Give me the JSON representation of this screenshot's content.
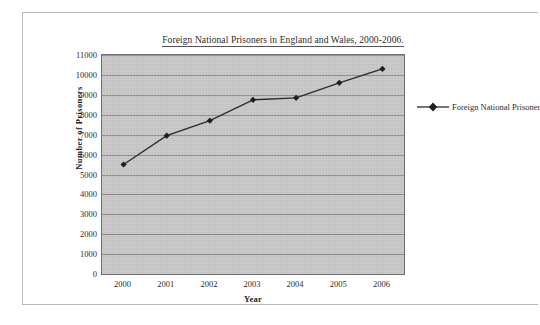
{
  "chart_data": {
    "type": "line",
    "title": "Foreign National Prisoners in England and Wales, 2000-2006.",
    "xlabel": "Year",
    "ylabel": "Number of Prisoners",
    "categories": [
      "2000",
      "2001",
      "2002",
      "2003",
      "2004",
      "2005",
      "2006"
    ],
    "series": [
      {
        "name": "Foreign National Prisoner",
        "values": [
          5500,
          6950,
          7700,
          8750,
          8850,
          9600,
          10300
        ]
      }
    ],
    "ylim": [
      0,
      11000
    ],
    "ytick_step": 1000,
    "yticks": [
      "11000",
      "10000",
      "9000",
      "8000",
      "7000",
      "6000",
      "5000",
      "4000",
      "3000",
      "2000",
      "1000",
      "0"
    ],
    "grid": "horizontal",
    "legend_position": "right",
    "plot_background_color": "#c9c9c9",
    "series_color": "#2a2a2a",
    "marker": "diamond"
  },
  "legend": {
    "entries": [
      {
        "label": "Foreign National Prisoner",
        "marker_icon": "diamond-marker-icon"
      }
    ]
  }
}
